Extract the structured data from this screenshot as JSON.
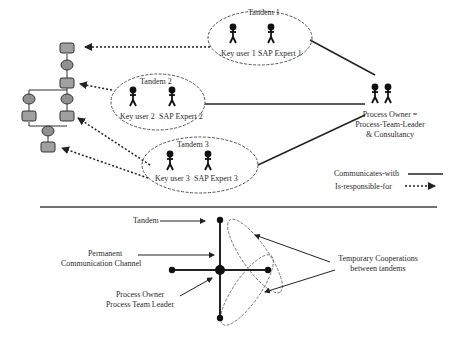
{
  "top_diagram": {
    "tandems": [
      {
        "title": "Tandem 1",
        "members": [
          "Key user 1",
          "SAP Expert 1"
        ]
      },
      {
        "title": "Tandem 2",
        "members": [
          "Key user 2",
          "SAP Expert 2"
        ]
      },
      {
        "title": "Tandem 3",
        "members": [
          "Key user 3",
          "SAP Expert 3"
        ]
      }
    ],
    "process_owner": {
      "line1": "Process Owner =",
      "line2": "Process-Team-Leader",
      "line3": "& Consultancy"
    },
    "legend": {
      "communicates": "Communicates-with",
      "responsible": "Is-responsible-for"
    }
  },
  "bottom_diagram": {
    "tandem_label": "Tandem",
    "channel_line1": "Permanent",
    "channel_line2": "Communication Channel",
    "owner_line1": "Process Owner",
    "owner_line2": "Process  Team  Leader",
    "temp_line1": "Temporary Cooperations",
    "temp_line2": "between tandems"
  },
  "colors": {
    "process_box": "#a0a0a0",
    "line": "#222222",
    "ellipse": "#666666"
  }
}
